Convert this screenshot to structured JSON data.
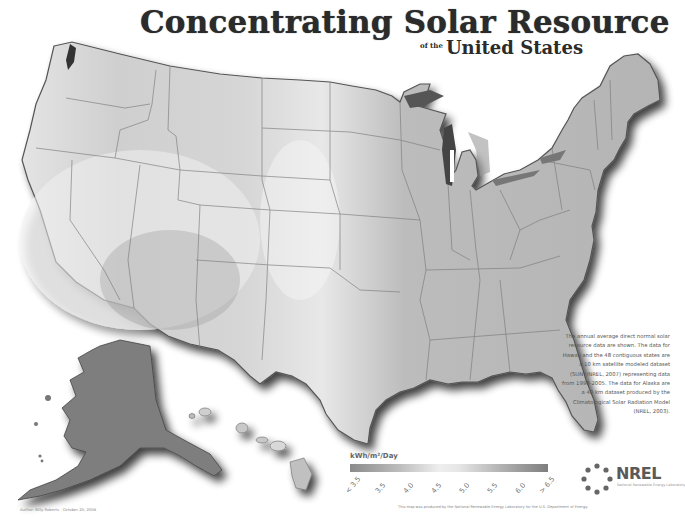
{
  "map": {
    "title": "Concentrating Solar Resource",
    "subtitle_of": "of the",
    "subtitle": "United States",
    "regions": [
      "Contiguous United States",
      "Alaska",
      "Hawaii"
    ],
    "colormap": "grayscale (light = high resource, dark = low resource)"
  },
  "legend": {
    "title": "kWh/m²/Day",
    "ticks": [
      "< 3.5",
      "3.5",
      "4.0",
      "4.5",
      "5.0",
      "5.5",
      "6.0",
      "> 6.5"
    ],
    "colors": [
      "#8a8a8a",
      "#bdbdbd",
      "#eeeeee",
      "#e6e6e6",
      "#a9a9a9",
      "#7e7e7e"
    ]
  },
  "side_note": "The annual average direct normal solar resource data are shown. The data for Hawaii and the 48 contiguous states are a 10 km satellite modeled dataset (SUNY/NREL, 2007) representing data from 1998-2005. The data for Alaska are a 40 km dataset produced by the Climatological Solar Radiation Model (NREL, 2003).",
  "credit_line": "This map was produced by the National Renewable Energy Laboratory for the U.S. Department of Energy.",
  "author": "Author: Billy Roberts - October 20, 2008",
  "logo": {
    "name": "NREL",
    "tagline": "National Renewable Energy Laboratory"
  }
}
